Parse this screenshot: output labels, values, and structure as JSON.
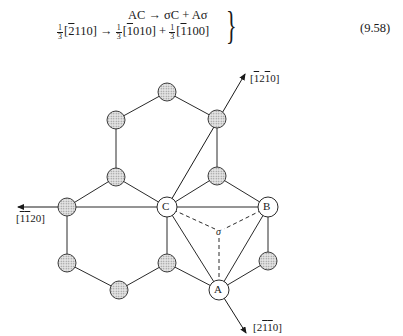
{
  "equation": {
    "number": "(9.58)",
    "line1": {
      "text": "AC → σC + Aσ"
    },
    "line2": {
      "frac_num": "1",
      "frac_den": "3",
      "term1_prefix": "[",
      "term1_bar": "2",
      "term1_rest": "110]",
      "arrow": " → ",
      "term2_prefix": "[",
      "term2_bar": "1",
      "term2_rest": "010]",
      "plus": " + ",
      "term3_prefix": "[",
      "term3_bar": "1",
      "term3_rest": "100]"
    }
  },
  "diagram": {
    "atom_labels": {
      "A": "A",
      "B": "B",
      "C": "C",
      "sigma": "σ"
    },
    "directions": {
      "up_right": {
        "pre": "[",
        "b1": "1",
        "m1": "2",
        "b2": "1",
        "post": "0]"
      },
      "left": {
        "pre": "[",
        "b1": "1",
        "b2": "1",
        "post": "20]"
      },
      "down_right": {
        "pre": "[2",
        "b1": "1",
        "b2": "1",
        "post": "0]"
      }
    },
    "colors": {
      "line": "#2a2a2a",
      "shaded_fill": "#c8c8c8",
      "open_fill": "#ffffff"
    }
  }
}
